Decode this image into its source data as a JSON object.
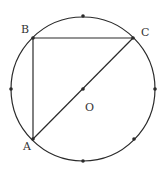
{
  "diagram": {
    "type": "geometry-circle",
    "stroke_color": "#2a2a2a",
    "background": "#ffffff",
    "circle": {
      "center_label": "O",
      "cx": 83,
      "cy": 89,
      "r": 72
    },
    "points": [
      {
        "label": "A",
        "x": 33,
        "y": 139,
        "label_x": 23,
        "label_y": 150
      },
      {
        "label": "B",
        "x": 33,
        "y": 38,
        "label_x": 21,
        "label_y": 33
      },
      {
        "label": "C",
        "x": 133,
        "y": 38,
        "label_x": 141,
        "label_y": 36
      },
      {
        "label": "O",
        "x": 83,
        "y": 89,
        "label_x": 85,
        "label_y": 111
      }
    ],
    "segments": [
      {
        "from": "A",
        "to": "B"
      },
      {
        "from": "B",
        "to": "C"
      },
      {
        "from": "A",
        "to": "C"
      }
    ],
    "circle_marks": [
      {
        "x": 83,
        "y": 16
      },
      {
        "x": 11,
        "y": 89
      },
      {
        "x": 155,
        "y": 89
      },
      {
        "x": 83,
        "y": 161
      },
      {
        "x": 134,
        "y": 139
      }
    ]
  }
}
